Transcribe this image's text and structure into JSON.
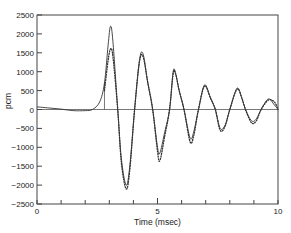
{
  "chart_data": {
    "type": "line",
    "title": "",
    "xlabel": "Time (msec)",
    "ylabel": "pcm",
    "xlim": [
      0,
      10
    ],
    "ylim": [
      -2500,
      2500
    ],
    "grid": false,
    "legend": null,
    "x_ticks": [
      0,
      1,
      2,
      3,
      4,
      5,
      6,
      7,
      8,
      9,
      10
    ],
    "x_tick_labels": [
      "0",
      "5",
      "10"
    ],
    "x_tick_label_values": [
      0,
      5,
      10
    ],
    "y_ticks": [
      2500,
      2000,
      1500,
      1000,
      500,
      0,
      -500,
      -1000,
      -1500,
      -2000,
      -2500
    ],
    "y_tick_labels": [
      "2500",
      "2000",
      "1500",
      "1000",
      "500",
      "0",
      "-500",
      "-1000",
      "-1500",
      "-2000",
      "-2500"
    ],
    "zero_line": true,
    "marker_line": {
      "x": 2.8,
      "from": 0,
      "to": 700
    },
    "series": [
      {
        "name": "calculated",
        "style": "solid",
        "color": "#333333",
        "x": [
          0,
          0.5,
          1,
          1.5,
          2,
          2.3,
          2.6,
          2.8,
          2.95,
          3.05,
          3.15,
          3.35,
          3.5,
          3.7,
          3.85,
          4.05,
          4.25,
          4.4,
          4.6,
          4.8,
          5.0,
          5.1,
          5.3,
          5.5,
          5.65,
          5.75,
          5.9,
          6.1,
          6.35,
          6.5,
          6.7,
          6.95,
          7.2,
          7.4,
          7.6,
          7.8,
          8.0,
          8.3,
          8.5,
          8.65,
          8.9,
          9.1,
          9.3,
          9.6,
          9.85,
          10
        ],
        "values": [
          70,
          40,
          10,
          -30,
          -30,
          0,
          200,
          700,
          1700,
          2200,
          1800,
          0,
          -1300,
          -2000,
          -1500,
          0,
          1300,
          1470,
          700,
          0,
          -1000,
          -1150,
          -600,
          0,
          1000,
          950,
          500,
          0,
          -750,
          -600,
          0,
          650,
          300,
          0,
          -500,
          -420,
          0,
          560,
          300,
          0,
          -300,
          -250,
          0,
          280,
          120,
          0
        ]
      },
      {
        "name": "measured",
        "style": "dotted",
        "color": "#333333",
        "x": [
          2.8,
          2.95,
          3.05,
          3.15,
          3.35,
          3.5,
          3.7,
          3.85,
          4.05,
          4.25,
          4.4,
          4.6,
          4.8,
          5.0,
          5.1,
          5.3,
          5.5,
          5.65,
          5.75,
          5.9,
          6.1,
          6.35,
          6.5,
          6.7,
          6.95,
          7.2,
          7.4,
          7.6,
          7.8,
          8.0,
          8.3,
          8.5,
          8.65,
          8.9,
          9.1,
          9.3,
          9.6,
          9.85,
          10
        ],
        "values": [
          500,
          1300,
          1600,
          1400,
          0,
          -1400,
          -2100,
          -1600,
          0,
          1250,
          1400,
          700,
          0,
          -1100,
          -1350,
          -700,
          0,
          950,
          950,
          500,
          0,
          -850,
          -700,
          0,
          620,
          300,
          0,
          -550,
          -450,
          0,
          540,
          300,
          0,
          -350,
          -300,
          0,
          250,
          200,
          0
        ]
      }
    ]
  }
}
